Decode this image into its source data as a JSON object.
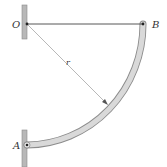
{
  "diagram": {
    "type": "mechanics-figure",
    "labels": {
      "O": "O",
      "B": "B",
      "A": "A",
      "r": "r"
    },
    "colors": {
      "background": "#ffffff",
      "wall": "#b8b8b8",
      "wall_edge": "#8a8a8a",
      "rod": "#444444",
      "bar_fill": "#d9d9d9",
      "bar_edge": "#8c8c8c",
      "radius_line": "#9a9a9a",
      "pin": "#222222",
      "text": "#333333"
    },
    "elements": [
      {
        "name": "upper-wall-support",
        "at": "O"
      },
      {
        "name": "horizontal-rod",
        "from": "O",
        "to": "B"
      },
      {
        "name": "curved-bar",
        "from": "B",
        "to": "A",
        "shape": "quarter-circle arc"
      },
      {
        "name": "lower-wall-support",
        "at": "A"
      },
      {
        "name": "radius-dimension",
        "from": "O",
        "to": "curved-bar",
        "label": "r"
      }
    ]
  }
}
